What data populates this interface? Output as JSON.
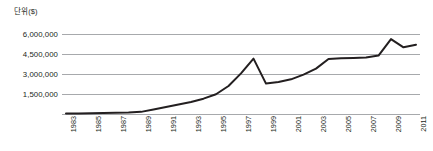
{
  "chart_data": {
    "type": "line",
    "title": "",
    "subtitle": "",
    "unit_label": "단위($)",
    "xlabel": "",
    "ylabel": "",
    "ylim": [
      0,
      6750000
    ],
    "grid": true,
    "grid_axis": "y",
    "legend": false,
    "legend_position": "none",
    "y_ticks": [
      6000000,
      4500000,
      3000000,
      1500000
    ],
    "y_tick_labels": [
      "6,000,000",
      "4,500,000",
      "3,000,000",
      "1,500,000"
    ],
    "x_tick_labels": [
      "1983",
      "1985",
      "1987",
      "1989",
      "1991",
      "1993",
      "1995",
      "1997",
      "1999",
      "2001",
      "2003",
      "2005",
      "2007",
      "2009",
      "2011"
    ],
    "x": [
      1983,
      1984,
      1985,
      1986,
      1987,
      1988,
      1989,
      1990,
      1991,
      1992,
      1993,
      1994,
      1995,
      1996,
      1997,
      1998,
      1999,
      2000,
      2001,
      2002,
      2003,
      2004,
      2005,
      2006,
      2007,
      2008,
      2009,
      2010,
      2011
    ],
    "values": [
      30000,
      40000,
      55000,
      70000,
      85000,
      110000,
      160000,
      330000,
      520000,
      720000,
      900000,
      1150000,
      1480000,
      2100000,
      3050000,
      4150000,
      2280000,
      2400000,
      2600000,
      2950000,
      3400000,
      4120000,
      4180000,
      4200000,
      4230000,
      4380000,
      5620000,
      5000000,
      5200000
    ],
    "series": [
      {
        "name": "value",
        "color": "#231f20",
        "values": [
          30000,
          40000,
          55000,
          70000,
          85000,
          110000,
          160000,
          330000,
          520000,
          720000,
          900000,
          1150000,
          1480000,
          2100000,
          3050000,
          4150000,
          2280000,
          2400000,
          2600000,
          2950000,
          3400000,
          4120000,
          4180000,
          4200000,
          4230000,
          4380000,
          5620000,
          5000000,
          5200000
        ]
      }
    ],
    "colors": {
      "line": "#231f20",
      "grid": "#a7a9ac",
      "text": "#231f20",
      "background": "#ffffff"
    }
  }
}
